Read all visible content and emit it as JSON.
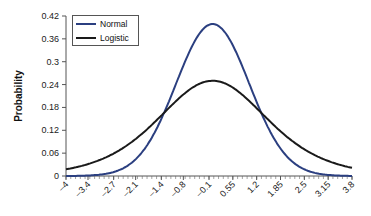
{
  "chart_data": {
    "type": "line",
    "title": "",
    "xlabel": "",
    "ylabel": "Probability",
    "ylim": [
      0,
      0.42
    ],
    "xlim": [
      -4,
      3.8
    ],
    "yticks": [
      "0",
      "0.06",
      "0.12",
      "0.18",
      "0.24",
      "0.3",
      "0.36",
      "0.42"
    ],
    "xticks": [
      "-4",
      "-3.4",
      "-2.7",
      "-2.1",
      "-1.4",
      "-0.8",
      "-0.1",
      "0.55",
      "1.2",
      "1.85",
      "2.5",
      "3.15",
      "3.8"
    ],
    "grid": false,
    "legend_position": "top-left",
    "series": [
      {
        "name": "Normal",
        "color": "#2b3f80",
        "distribution": "normal",
        "mean": 0,
        "sd": 1,
        "peak": 0.399
      },
      {
        "name": "Logistic",
        "color": "#1a1a1a",
        "distribution": "logistic",
        "location": 0,
        "scale": 1,
        "peak": 0.25
      }
    ]
  },
  "legend": {
    "items": [
      {
        "label": "Normal",
        "color": "#2b3f80"
      },
      {
        "label": "Logistic",
        "color": "#1a1a1a"
      }
    ]
  }
}
